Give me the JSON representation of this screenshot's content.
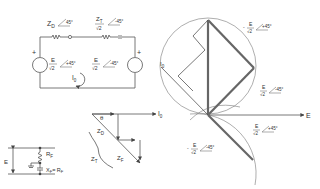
{
  "circuit": {
    "zd_label": "Z",
    "zd_sub": "D",
    "zd_angle": "45°",
    "zt_label": "Z",
    "zt_sub": "T",
    "zt_den": "√2",
    "zt_angle": "-45°",
    "src_left_num": "E",
    "src_left_den": "√2",
    "src_left_angle": "+45°",
    "src_right_num": "E",
    "src_right_den": "√2",
    "src_right_angle": "-45°",
    "plus_left": "+",
    "plus_right": "+",
    "loop_current": "I",
    "loop_current_sub": "0"
  },
  "fault_circuit": {
    "e_label": "E",
    "rf_label": "R",
    "rf_sub": "F",
    "xf_label": "X",
    "xf_sub": "F",
    "xf_eq": "= R",
    "xf_eq_sub": "F"
  },
  "impedance_triangle": {
    "theta": "θ",
    "io_label": "I",
    "io_sub": "0",
    "zd_label": "Z",
    "zd_sub": "D",
    "zt_label": "Z",
    "zt_sub": "T",
    "zf_label": "Z",
    "zf_sub": "F"
  },
  "phasor_diagram": {
    "io_label": "I",
    "io_sub": "0",
    "e_axis": "E",
    "label_top": {
      "sign": "-",
      "num": "E",
      "den": "√2",
      "angle": "+45°"
    },
    "label_mid": {
      "sign": "",
      "num": "E",
      "den": "√2",
      "angle": "-45°"
    },
    "label_low": {
      "sign": "",
      "num": "E",
      "den": "√2",
      "angle": "+45°"
    },
    "label_bottom": {
      "sign": "-",
      "num": "E",
      "den": "√2",
      "angle": "-45°"
    }
  }
}
